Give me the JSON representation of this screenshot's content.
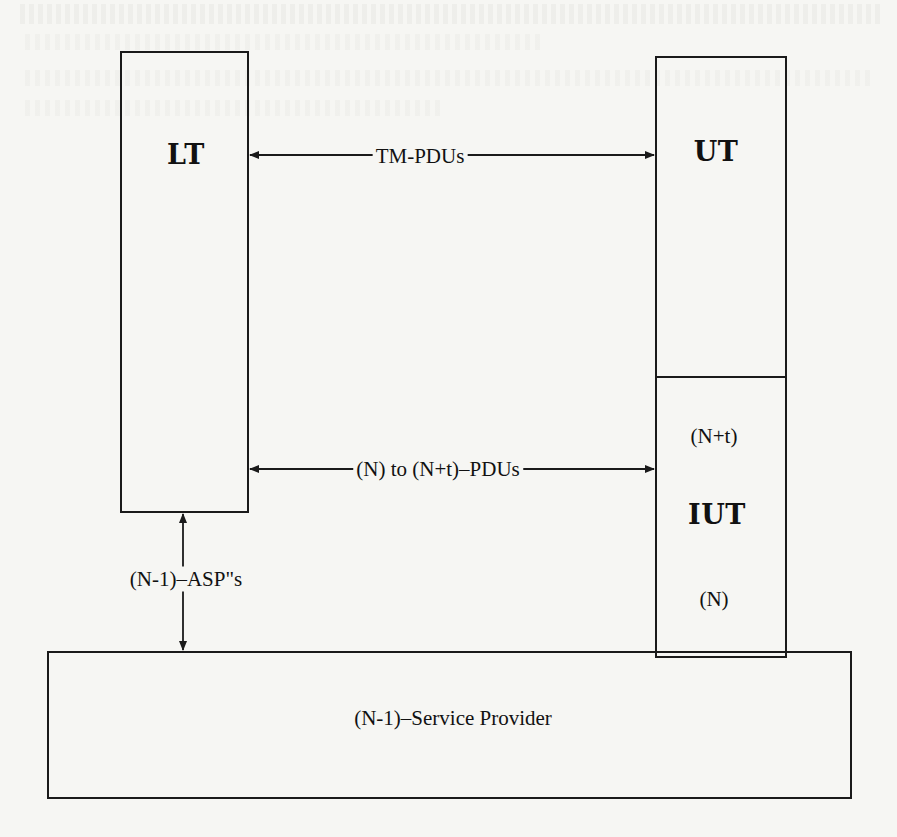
{
  "diagram": {
    "type": "protocol-test-architecture",
    "boxes": {
      "lower_tester": {
        "label": "LT"
      },
      "upper_tester": {
        "label": "UT"
      },
      "iut": {
        "label": "IUT",
        "upper_layer": "(N+t)",
        "lower_layer": "(N)"
      },
      "service_provider": {
        "label": "(N-1)–Service Provider"
      }
    },
    "arrows": {
      "tm_pdus": {
        "label": "TM-PDUs",
        "from": "LT",
        "to": "UT",
        "direction": "bidirectional"
      },
      "n_pdus": {
        "label": "(N) to (N+t)–PDUs",
        "from": "LT",
        "to": "IUT",
        "direction": "bidirectional"
      },
      "asps": {
        "label": "(N-1)–ASP\"s",
        "from": "LT",
        "to": "(N-1)-Service Provider",
        "direction": "bidirectional"
      }
    },
    "colors": {
      "line": "#1a1a1a",
      "paper": "#f6f6f3"
    }
  }
}
